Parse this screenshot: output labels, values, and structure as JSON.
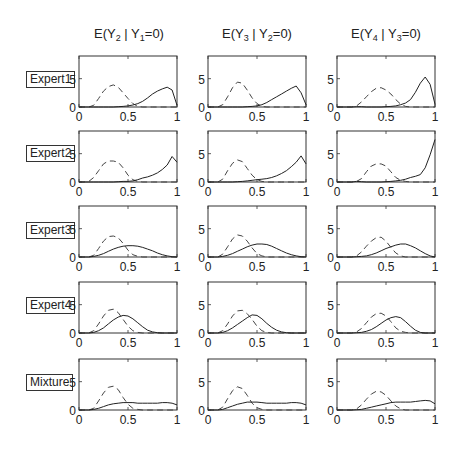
{
  "figure": {
    "columns": [
      {
        "title_pre": "E(Y",
        "title_sub1": "2",
        "title_mid": " | Y",
        "title_sub2": "1",
        "title_post": "=0)"
      },
      {
        "title_pre": "E(Y",
        "title_sub1": "3",
        "title_mid": " | Y",
        "title_sub2": "2",
        "title_post": "=0)"
      },
      {
        "title_pre": "E(Y",
        "title_sub1": "4",
        "title_mid": " | Y",
        "title_sub2": "3",
        "title_post": "=0)"
      }
    ],
    "rows": [
      {
        "label": "Expert1"
      },
      {
        "label": "Expert2"
      },
      {
        "label": "Expert3"
      },
      {
        "label": "Expert4"
      },
      {
        "label": "Mixture"
      }
    ],
    "xticks": [
      "0",
      "0.5",
      "1"
    ],
    "yticks": [
      "0",
      "5"
    ]
  },
  "chart_data": {
    "type": "line",
    "title": "",
    "layout": "5x3 grid of density plots",
    "xlabel": "",
    "ylabel": "",
    "xlim": [
      0,
      1
    ],
    "ylim": [
      0,
      9
    ],
    "grid": false,
    "legend": "none",
    "x": [
      0,
      0.05,
      0.1,
      0.15,
      0.2,
      0.25,
      0.3,
      0.35,
      0.4,
      0.45,
      0.5,
      0.55,
      0.6,
      0.65,
      0.7,
      0.75,
      0.8,
      0.85,
      0.9,
      0.95,
      1.0
    ],
    "series_styles": {
      "solid": "expert/mixture density",
      "dashed": "reference density"
    },
    "panels": [
      {
        "row": "Expert1",
        "col": "E(Y2 | Y1=0)",
        "dashed": [
          0,
          0,
          0,
          0.3,
          1.5,
          2.8,
          3.6,
          3.9,
          3.5,
          2.5,
          1.5,
          0.6,
          0.1,
          0,
          0,
          0,
          0,
          0,
          0,
          0,
          0
        ],
        "solid": [
          0,
          0,
          0,
          0,
          0,
          0,
          0,
          0,
          0.05,
          0.1,
          0.2,
          0.35,
          0.6,
          1.0,
          1.6,
          2.3,
          2.8,
          3.2,
          3.5,
          3.0,
          0.3
        ]
      },
      {
        "row": "Expert1",
        "col": "E(Y3 | Y2=0)",
        "dashed": [
          0,
          0,
          0,
          0.4,
          1.8,
          3.4,
          4.4,
          4.2,
          3.0,
          1.6,
          0.6,
          0.1,
          0,
          0,
          0,
          0,
          0,
          0,
          0,
          0,
          0
        ],
        "solid": [
          0,
          0,
          0,
          0,
          0,
          0,
          0,
          0,
          0.05,
          0.1,
          0.2,
          0.4,
          0.8,
          1.3,
          1.8,
          2.3,
          2.8,
          3.3,
          3.7,
          2.5,
          0.4
        ]
      },
      {
        "row": "Expert1",
        "col": "E(Y4 | Y3=0)",
        "dashed": [
          0,
          0,
          0,
          0,
          0.2,
          0.9,
          1.8,
          2.7,
          3.3,
          3.4,
          3.0,
          2.3,
          1.3,
          0.5,
          0.1,
          0,
          0,
          0,
          0,
          0,
          0
        ],
        "solid": [
          0,
          0,
          0,
          0,
          0.05,
          0.05,
          0,
          0,
          0,
          0,
          0.05,
          0.1,
          0.2,
          0.4,
          0.7,
          1.3,
          2.6,
          4.2,
          5.3,
          4.0,
          0.5
        ]
      },
      {
        "row": "Expert2",
        "col": "E(Y2 | Y1=0)",
        "dashed": [
          0,
          0,
          0.1,
          0.8,
          2.0,
          3.2,
          3.7,
          3.7,
          3.5,
          2.5,
          1.2,
          0.4,
          0.1,
          0,
          0,
          0,
          0,
          0,
          0,
          0,
          0
        ],
        "solid": [
          0,
          0,
          0,
          0,
          0,
          0,
          0,
          0,
          0.05,
          0.1,
          0.1,
          0.2,
          0.4,
          0.7,
          0.9,
          1.2,
          1.6,
          2.2,
          3.0,
          4.5,
          3.5
        ]
      },
      {
        "row": "Expert2",
        "col": "E(Y3 | Y2=0)",
        "dashed": [
          0,
          0,
          0,
          0.5,
          2.0,
          3.3,
          3.9,
          3.6,
          2.4,
          1.2,
          0.4,
          0.1,
          0,
          0,
          0,
          0,
          0,
          0,
          0,
          0,
          0
        ],
        "solid": [
          0,
          0,
          0,
          0,
          0,
          0,
          0.05,
          0.1,
          0.2,
          0.3,
          0.4,
          0.5,
          0.6,
          0.8,
          1.1,
          1.5,
          2.0,
          2.7,
          3.5,
          4.6,
          3.2
        ]
      },
      {
        "row": "Expert2",
        "col": "E(Y4 | Y3=0)",
        "dashed": [
          0,
          0,
          0,
          0,
          0.1,
          0.6,
          1.8,
          2.8,
          3.2,
          3.2,
          2.8,
          1.8,
          0.8,
          0.3,
          0.1,
          0,
          0,
          0,
          0,
          0,
          0
        ],
        "solid": [
          0,
          0,
          0,
          0,
          0.1,
          0.05,
          0,
          0,
          0,
          0,
          0.05,
          0.1,
          0.2,
          0.3,
          0.5,
          0.8,
          1.0,
          1.3,
          2.5,
          4.8,
          7.5
        ]
      },
      {
        "row": "Expert3",
        "col": "E(Y2 | Y1=0)",
        "dashed": [
          0,
          0,
          0,
          0.3,
          1.5,
          2.8,
          3.6,
          3.7,
          3.4,
          2.4,
          1.2,
          0.4,
          0.1,
          0,
          0,
          0,
          0,
          0,
          0,
          0,
          0
        ],
        "solid": [
          0,
          0,
          0,
          0.1,
          0.3,
          0.6,
          1.0,
          1.4,
          1.7,
          1.9,
          2.0,
          2.0,
          1.9,
          1.7,
          1.4,
          1.1,
          0.7,
          0.4,
          0.2,
          0.05,
          0
        ]
      },
      {
        "row": "Expert3",
        "col": "E(Y3 | Y2=0)",
        "dashed": [
          0,
          0,
          0,
          0.5,
          1.8,
          3.2,
          3.9,
          3.7,
          2.8,
          1.6,
          0.6,
          0.2,
          0,
          0,
          0,
          0,
          0,
          0,
          0,
          0,
          0
        ],
        "solid": [
          0,
          0,
          0,
          0.1,
          0.3,
          0.6,
          1.0,
          1.4,
          1.8,
          2.1,
          2.3,
          2.3,
          2.2,
          1.9,
          1.5,
          1.1,
          0.7,
          0.4,
          0.2,
          0.05,
          0
        ]
      },
      {
        "row": "Expert3",
        "col": "E(Y4 | Y3=0)",
        "dashed": [
          0,
          0,
          0,
          0,
          0.2,
          0.9,
          1.9,
          2.8,
          3.4,
          3.5,
          2.8,
          1.7,
          0.7,
          0.2,
          0,
          0,
          0,
          0,
          0,
          0,
          0
        ],
        "solid": [
          0,
          0,
          0,
          0,
          0.05,
          0.1,
          0.2,
          0.4,
          0.7,
          1.1,
          1.5,
          1.8,
          2.1,
          2.3,
          2.3,
          2.0,
          1.6,
          1.1,
          0.6,
          0.2,
          0
        ]
      },
      {
        "row": "Expert4",
        "col": "E(Y2 | Y1=0)",
        "dashed": [
          0,
          0,
          0,
          0.4,
          1.6,
          3.0,
          4.0,
          4.2,
          3.6,
          2.4,
          1.2,
          0.4,
          0.1,
          0,
          0,
          0,
          0,
          0,
          0,
          0,
          0
        ],
        "solid": [
          0,
          0,
          0,
          0.1,
          0.4,
          0.9,
          1.6,
          2.3,
          2.8,
          3.1,
          3.0,
          2.5,
          1.8,
          1.1,
          0.5,
          0.2,
          0.05,
          0,
          0,
          0,
          0
        ]
      },
      {
        "row": "Expert4",
        "col": "E(Y3 | Y2=0)",
        "dashed": [
          0,
          0,
          0,
          0.4,
          1.6,
          3.0,
          3.9,
          4.0,
          3.4,
          2.4,
          1.2,
          0.4,
          0.1,
          0,
          0,
          0,
          0,
          0,
          0,
          0,
          0
        ],
        "solid": [
          0,
          0,
          0,
          0.1,
          0.4,
          0.9,
          1.5,
          2.1,
          2.7,
          3.2,
          3.1,
          2.5,
          1.7,
          1.0,
          0.5,
          0.2,
          0.05,
          0,
          0,
          0,
          0
        ]
      },
      {
        "row": "Expert4",
        "col": "E(Y4 | Y3=0)",
        "dashed": [
          0,
          0,
          0,
          0,
          0.2,
          0.8,
          1.8,
          2.8,
          3.4,
          3.5,
          3.0,
          2.0,
          0.9,
          0.3,
          0.1,
          0,
          0,
          0,
          0,
          0,
          0
        ],
        "solid": [
          0,
          0,
          0,
          0,
          0.05,
          0.1,
          0.3,
          0.6,
          1.1,
          1.7,
          2.3,
          2.7,
          2.9,
          2.7,
          2.0,
          1.2,
          0.5,
          0.1,
          0,
          0,
          0
        ]
      },
      {
        "row": "Mixture",
        "col": "E(Y2 | Y1=0)",
        "dashed": [
          0,
          0,
          0,
          0.3,
          1.6,
          3.0,
          4.0,
          4.2,
          3.6,
          2.2,
          1.0,
          0.3,
          0.1,
          0,
          0,
          0,
          0,
          0,
          0,
          0,
          0
        ],
        "solid": [
          0,
          0,
          0,
          0.1,
          0.3,
          0.6,
          0.9,
          1.1,
          1.2,
          1.3,
          1.3,
          1.3,
          1.2,
          1.2,
          1.2,
          1.2,
          1.2,
          1.3,
          1.3,
          1.2,
          0.9
        ]
      },
      {
        "row": "Mixture",
        "col": "E(Y3 | Y2=0)",
        "dashed": [
          0,
          0,
          0,
          0.5,
          2.0,
          3.4,
          4.1,
          3.8,
          2.6,
          1.2,
          0.4,
          0.1,
          0,
          0,
          0,
          0,
          0,
          0,
          0,
          0,
          0
        ],
        "solid": [
          0,
          0,
          0,
          0.1,
          0.4,
          0.7,
          1.0,
          1.2,
          1.4,
          1.4,
          1.4,
          1.3,
          1.2,
          1.2,
          1.2,
          1.2,
          1.2,
          1.3,
          1.3,
          1.2,
          0.9
        ]
      },
      {
        "row": "Mixture",
        "col": "E(Y4 | Y3=0)",
        "dashed": [
          0,
          0,
          0,
          0,
          0.2,
          0.9,
          1.9,
          2.8,
          3.3,
          3.2,
          2.6,
          1.6,
          0.7,
          0.2,
          0,
          0,
          0,
          0,
          0,
          0,
          0
        ],
        "solid": [
          0,
          0,
          0,
          0,
          0.05,
          0.1,
          0.3,
          0.5,
          0.7,
          0.9,
          1.1,
          1.3,
          1.4,
          1.4,
          1.4,
          1.4,
          1.5,
          1.6,
          1.7,
          1.6,
          1.1
        ]
      }
    ]
  }
}
